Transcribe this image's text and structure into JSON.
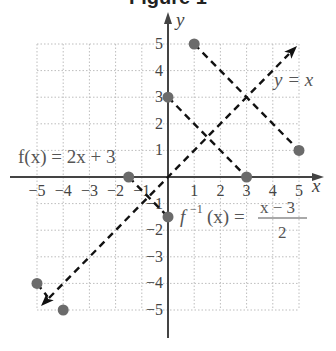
{
  "title": "Figure 1",
  "axes": {
    "x_label": "x",
    "y_label": "y",
    "x_ticks": [
      "−5",
      "−4",
      "−3",
      "−2",
      "−1",
      "1",
      "2",
      "3",
      "4",
      "5"
    ],
    "x_tick_values": [
      -5,
      -4,
      -3,
      -2,
      -1,
      1,
      2,
      3,
      4,
      5
    ],
    "y_ticks": [
      "5",
      "4",
      "3",
      "2",
      "1",
      "−1",
      "−2",
      "−3",
      "−4",
      "−5"
    ],
    "y_tick_values": [
      5,
      4,
      3,
      2,
      1,
      -1,
      -2,
      -3,
      -4,
      -5
    ],
    "range": {
      "x": [
        -5,
        5
      ],
      "y": [
        -5,
        5
      ]
    },
    "grid": true
  },
  "labels": {
    "f": "f(x) = 2x + 3",
    "f_inv_lhs": "f",
    "f_inv_sup": "−1",
    "f_inv_arg": "(x) =",
    "f_inv_num": "x − 3",
    "f_inv_den": "2",
    "identity": "y = x"
  },
  "segments": [
    {
      "name": "f-line-upper",
      "from": [
        0,
        3
      ],
      "to": [
        3,
        0
      ]
    },
    {
      "name": "f-inverse-line",
      "from": [
        1,
        5
      ],
      "to": [
        5,
        1
      ]
    },
    {
      "name": "f-line-lower",
      "from": [
        -1.5,
        0
      ],
      "to": [
        0,
        -1.5
      ]
    },
    {
      "name": "lower-left-stub",
      "from": [
        -5,
        -4
      ],
      "to": [
        -4.6,
        -4.5
      ]
    }
  ],
  "points": [
    {
      "x": 1,
      "y": 5
    },
    {
      "x": 0,
      "y": 3
    },
    {
      "x": 5,
      "y": 1
    },
    {
      "x": 3,
      "y": 0
    },
    {
      "x": -1.5,
      "y": 0
    },
    {
      "x": 0,
      "y": -1.5
    },
    {
      "x": -5,
      "y": -4
    },
    {
      "x": -4,
      "y": -5
    }
  ],
  "identity_line": {
    "from": [
      -5,
      -5
    ],
    "to": [
      5,
      5
    ],
    "arrows": "both"
  },
  "colors": {
    "axis": "#444444",
    "dash": "#111111",
    "point": "#6b6b6b",
    "grid": "#bdbdbd",
    "label": "#555555"
  }
}
